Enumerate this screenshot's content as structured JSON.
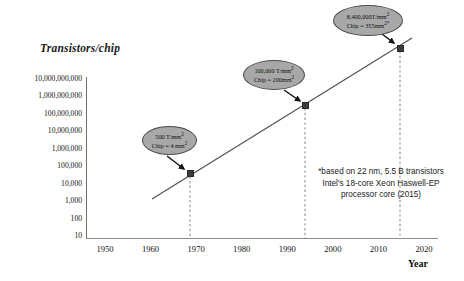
{
  "chart_data": {
    "type": "line",
    "title": "Transistors/chip",
    "xlabel": "Year",
    "ylabel": "Transistors/chip",
    "xlim": [
      1945,
      2022
    ],
    "ylim": [
      10,
      10000000000
    ],
    "yscale": "log",
    "grid": false,
    "legend": null,
    "xticks": [
      "1950",
      "1960",
      "1970",
      "1980",
      "1990",
      "2000",
      "2010",
      "2020"
    ],
    "xtick_values": [
      1950,
      1960,
      1970,
      1980,
      1990,
      2000,
      2010,
      2020
    ],
    "yticks": [
      "10,000,000,000",
      "1,000,000,000",
      "100,000,000",
      "10,000,000",
      "1,000,000",
      "100,000",
      "10,000",
      "1,000",
      "100",
      "10"
    ],
    "ytick_values": [
      10000000000,
      1000000000,
      100000000,
      10000000,
      1000000,
      100000,
      10000,
      1000,
      100,
      10
    ],
    "series": [
      {
        "name": "Transistors per chip",
        "x": [
          1968,
          1993,
          2015
        ],
        "y": [
          2000,
          20000000,
          2982000000
        ]
      }
    ],
    "points": [
      {
        "year": 1968,
        "density_label": "500 T/mm",
        "density_exp": "2",
        "chip_label": "Chip = 4 mm",
        "chip_exp": "2"
      },
      {
        "year": 1993,
        "density_label": "100,000 T/mm",
        "density_exp": "2",
        "chip_label": "Chip = 200mm",
        "chip_exp": "2"
      },
      {
        "year": 2015,
        "density_label": "8,400,000T/mm",
        "density_exp": "2",
        "chip_label": "Chip = 355mm",
        "chip_exp": "2*"
      }
    ],
    "annotations": [
      "*based on 22 nm, 5.5 B transistors Intel's 18-core Xeon Haswell-EP processor core (2015)"
    ],
    "colors": {
      "bubble_fill": "#a8a8a8",
      "bubble_stroke": "#4a4a4a",
      "trend_line": "#555555",
      "axis": "#6d6d6d",
      "marker": "#3a3a3a",
      "text": "#101010"
    }
  },
  "footnote": {
    "text": "*based on 22 nm, 5.5 B transistors Intel's 18-core Xeon Haswell-EP processor core (2015)"
  },
  "axis": {
    "y_title": "Transistors/chip",
    "x_caption": "Year"
  }
}
